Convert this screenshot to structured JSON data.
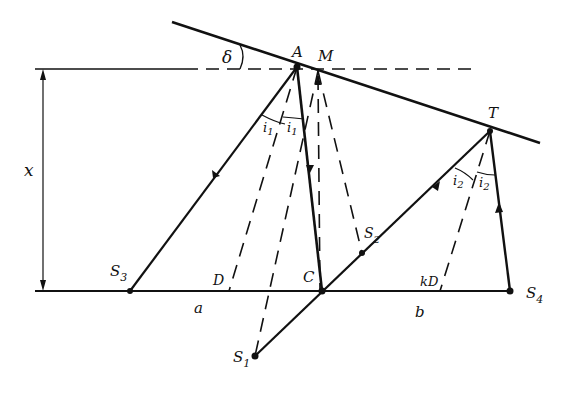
{
  "diagram": {
    "title": "",
    "colors": {
      "ink": "#111111",
      "background": "#ffffff"
    },
    "labels": {
      "A": "A",
      "M": "M",
      "T": "T",
      "delta": "δ",
      "x": "x",
      "S1": "S",
      "S1_sub": "1",
      "S2": "S",
      "S2_sub": "2",
      "S3": "S",
      "S3_sub": "3",
      "S4": "S",
      "S4_sub": "4",
      "C": "C",
      "D": "D",
      "kD": "kD",
      "a": "a",
      "b": "b",
      "i1_left": "i",
      "i1_left_sub": "1",
      "i1_right": "i",
      "i1_right_sub": "1",
      "i2_left": "i",
      "i2_left_sub": "2",
      "i2_right": "i",
      "i2_right_sub": "2"
    },
    "points": {
      "A": [
        297,
        67
      ],
      "M": [
        318,
        71
      ],
      "T": [
        490,
        131
      ],
      "S1": [
        255,
        356
      ],
      "S2": [
        362,
        253
      ],
      "S3": [
        130,
        291
      ],
      "S4": [
        510,
        291
      ],
      "C": [
        322,
        291
      ],
      "D": [
        229,
        291
      ],
      "kD": [
        440,
        291
      ]
    },
    "lines": {
      "reflector": "inclined reflecting boundary",
      "datum": "horizontal dashed reference through A",
      "baseline": "surface line S3–S4",
      "dimension": "depth x"
    }
  }
}
